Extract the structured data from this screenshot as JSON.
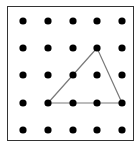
{
  "diagram": {
    "type": "dot-grid-geoboard",
    "grid": {
      "columns": 5,
      "rows": 5,
      "x": [
        23,
        48,
        73,
        97,
        122
      ],
      "y": [
        21,
        48,
        75,
        103,
        130
      ],
      "dot_radius": 3.6,
      "dot_color": "#000000"
    },
    "triangle": {
      "vertices_grid": [
        [
          3,
          1
        ],
        [
          1,
          3
        ],
        [
          4,
          3
        ]
      ],
      "stroke_color": "#7a7a7a",
      "stroke_width": 1.2
    },
    "frame_color": "#333333"
  }
}
